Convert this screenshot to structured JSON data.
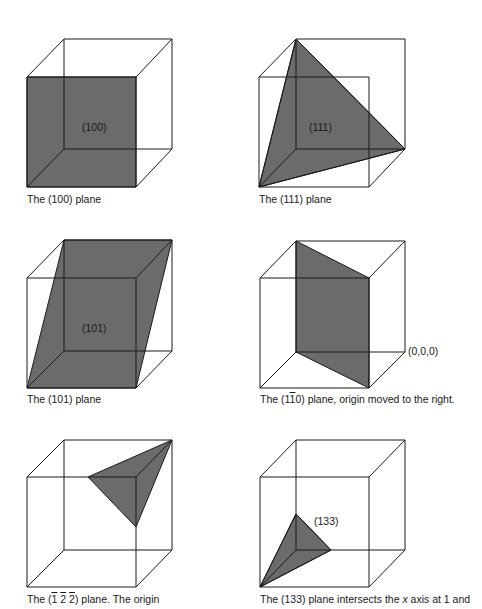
{
  "figure": {
    "panels": [
      {
        "id": "100",
        "plane_label": "(100)",
        "caption": "The (100) plane",
        "plane_color": "#6b6b6b"
      },
      {
        "id": "111",
        "plane_label": "(111)",
        "caption": "The (111) plane",
        "plane_color": "#6b6b6b"
      },
      {
        "id": "101",
        "plane_label": "(101)",
        "caption": "The (101) plane",
        "plane_color": "#6b6b6b"
      },
      {
        "id": "1-10",
        "origin_label": "(0,0,0)",
        "caption_prefix": "The (1",
        "caption_overbar": "1",
        "caption_suffix": "0) plane, origin moved to the right.",
        "plane_color": "#6b6b6b"
      },
      {
        "id": "-1-2-2",
        "caption_prefix": "The (",
        "caption_over1": "1",
        "caption_over2": "2",
        "caption_over3": "2",
        "caption_suffix": ") plane. The origin",
        "plane_color": "#6b6b6b"
      },
      {
        "id": "133",
        "plane_label": "(133)",
        "caption_prefix": "The (133) plane intersects the ",
        "caption_italic": "x",
        "caption_suffix": " axis at 1 and",
        "plane_color": "#6b6b6b"
      }
    ]
  }
}
